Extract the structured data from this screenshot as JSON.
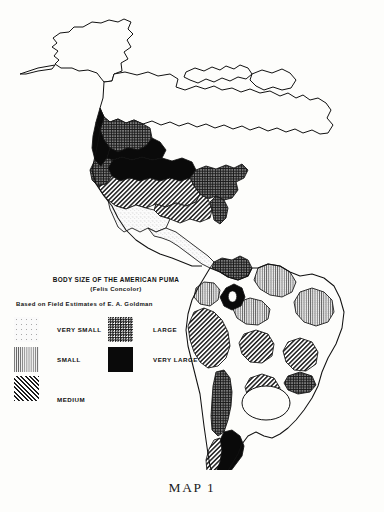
{
  "figure": {
    "caption": "MAP 1"
  },
  "legend": {
    "title": "BODY SIZE OF THE AMERICAN PUMA",
    "subtitle": "(Felis Concolor)",
    "source": "Based on Field Estimates of E. A. Goldman",
    "items": [
      {
        "label": "VERY SMALL",
        "pattern": "light-stipple",
        "color": "#fafafa"
      },
      {
        "label": "SMALL",
        "pattern": "fine-vertical-lines",
        "color": "#9a9a9a"
      },
      {
        "label": "MEDIUM",
        "pattern": "diagonal-hatch",
        "color": "#6b6b6b"
      },
      {
        "label": "LARGE",
        "pattern": "dense-dotted-dark",
        "color": "#1a1a1a"
      },
      {
        "label": "VERY LARGE",
        "pattern": "solid-black",
        "color": "#0a0a0a"
      }
    ]
  },
  "map": {
    "background_color": "#fdfdfb",
    "outline_color": "#111111",
    "regions": [
      {
        "name": "alaska",
        "class": "none"
      },
      {
        "name": "canada-arctic",
        "class": "none"
      },
      {
        "name": "western-canada",
        "class": "large"
      },
      {
        "name": "british-columbia",
        "class": "verylarge"
      },
      {
        "name": "northern-rockies",
        "class": "verylarge"
      },
      {
        "name": "central-plains-us",
        "class": "verylarge"
      },
      {
        "name": "pacific-northwest-us",
        "class": "large"
      },
      {
        "name": "eastern-us",
        "class": "large"
      },
      {
        "name": "southwest-us",
        "class": "medium"
      },
      {
        "name": "southeast-us",
        "class": "medium"
      },
      {
        "name": "baja-west-mexico",
        "class": "verysmall"
      },
      {
        "name": "central-america",
        "class": "verysmall"
      },
      {
        "name": "panama-colombia",
        "class": "large"
      },
      {
        "name": "venezuela-guiana",
        "class": "small"
      },
      {
        "name": "northwest-colombia",
        "class": "small"
      },
      {
        "name": "amazon-central",
        "class": "small"
      },
      {
        "name": "northeast-brazil",
        "class": "small"
      },
      {
        "name": "peru-bolivia-andes",
        "class": "medium"
      },
      {
        "name": "mato-grosso",
        "class": "medium"
      },
      {
        "name": "southeast-brazil",
        "class": "medium"
      },
      {
        "name": "gran-chaco",
        "class": "medium"
      },
      {
        "name": "central-andes-ring",
        "class": "verylarge"
      },
      {
        "name": "chile-andes",
        "class": "large"
      },
      {
        "name": "pampas-enclave",
        "class": "none"
      },
      {
        "name": "patagonia",
        "class": "verylarge"
      },
      {
        "name": "tierra-del-fuego",
        "class": "medium"
      }
    ]
  }
}
